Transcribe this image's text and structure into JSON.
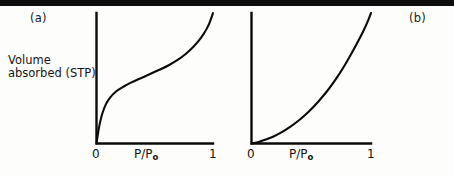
{
  "figure": {
    "background_color": "#fdfdfc",
    "ink_color": "#0b0b0b",
    "top_rule_color": "#0d0d0d"
  },
  "panels": {
    "a": {
      "label": "(a)",
      "ylabel_line1": "Volume",
      "ylabel_line2": "absorbed (STP)",
      "x_axis_name": "P/P",
      "x_axis_name_sub": "o",
      "x_tick_min": "0",
      "x_tick_max": "1"
    },
    "b": {
      "label": "(b)",
      "x_axis_name": "P/P",
      "x_axis_name_sub": "o",
      "x_tick_min": "0",
      "x_tick_max": "1"
    }
  },
  "chart_data": [
    {
      "type": "line",
      "title": "(a)",
      "xlabel": "P/Po",
      "ylabel": "Volume absorbed (STP)",
      "xlim": [
        0,
        1
      ],
      "ylim": [
        0,
        1
      ],
      "grid": false,
      "legend": "none",
      "xticks": [
        0,
        1
      ],
      "xticklabels": [
        "0",
        "1"
      ],
      "yticks": [],
      "yticklabels": [],
      "annotation": "Type II sigmoidal BET adsorption isotherm: steep initial uptake, monolayer knee, near-linear multilayer plateau, then sharp rise toward saturation at P/Po = 1",
      "series": [
        {
          "name": "Type II isotherm",
          "x": [
            0.0,
            0.015,
            0.03,
            0.05,
            0.08,
            0.12,
            0.17,
            0.23,
            0.3,
            0.38,
            0.46,
            0.54,
            0.62,
            0.7,
            0.77,
            0.83,
            0.88,
            0.92,
            0.95,
            0.97,
            0.985,
            1.0
          ],
          "y": [
            0.0,
            0.09,
            0.16,
            0.23,
            0.3,
            0.355,
            0.4,
            0.435,
            0.468,
            0.5,
            0.532,
            0.565,
            0.6,
            0.642,
            0.69,
            0.74,
            0.79,
            0.84,
            0.886,
            0.925,
            0.96,
            1.0
          ]
        }
      ]
    },
    {
      "type": "line",
      "title": "(b)",
      "xlabel": "P/Po",
      "ylabel": "",
      "xlim": [
        0,
        1
      ],
      "ylim": [
        0,
        1
      ],
      "grid": false,
      "legend": "none",
      "xticks": [
        0,
        1
      ],
      "xticklabels": [
        "0",
        "1"
      ],
      "yticks": [],
      "yticklabels": [],
      "annotation": "Type III adsorption isotherm: convex to the P/Po axis throughout, with no monolayer knee, rising steeply only near saturation",
      "series": [
        {
          "name": "Type III isotherm",
          "x": [
            0.0,
            0.06,
            0.12,
            0.18,
            0.25,
            0.32,
            0.4,
            0.48,
            0.56,
            0.64,
            0.72,
            0.8,
            0.87,
            0.93,
            0.97,
            1.0
          ],
          "y": [
            0.0,
            0.012,
            0.03,
            0.052,
            0.085,
            0.125,
            0.18,
            0.245,
            0.322,
            0.41,
            0.512,
            0.63,
            0.745,
            0.85,
            0.93,
            1.0
          ]
        }
      ]
    }
  ]
}
